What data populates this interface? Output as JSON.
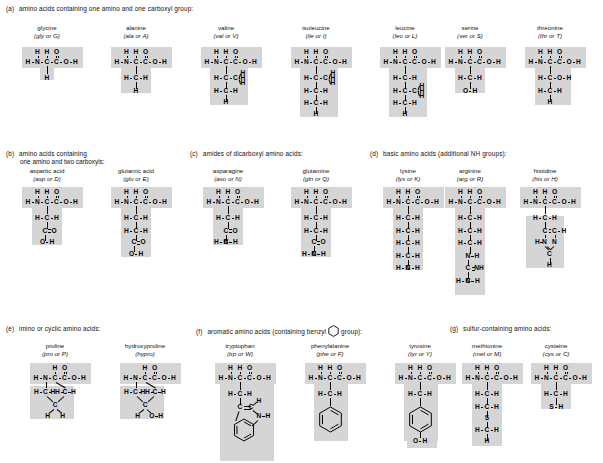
{
  "figure": {
    "shade_color": "#d5d5d5",
    "ink_color": "#000000",
    "background": "#ffffff"
  },
  "sections": [
    {
      "tag": "(a)",
      "heading": "amino acids containing one amino and one carboxyl group:",
      "heading_line2": "",
      "amino_acids": [
        {
          "name": "glycine",
          "abbr": "(gly or G)",
          "three_letter": "gly",
          "one_letter": "G",
          "backbone": "H-N-C-C-O-H",
          "side_chain_atoms": [
            "H"
          ],
          "side_chain_text": "H"
        },
        {
          "name": "alanine",
          "abbr": "(ala or A)",
          "three_letter": "ala",
          "one_letter": "A",
          "backbone": "H-N-C-C-O-H",
          "side_chain_atoms": [
            "H-C-H",
            "H"
          ],
          "side_chain_text": "CH3"
        },
        {
          "name": "valine",
          "abbr": "(val or V)",
          "three_letter": "val",
          "one_letter": "V",
          "backbone": "H-N-C-C-O-H",
          "side_chain_atoms": [
            "H-C-C(H)(H)(H)",
            "H-C-H",
            "H"
          ],
          "side_chain_text": "isopropyl branch"
        },
        {
          "name": "isoleucine",
          "abbr": "(ile or I)",
          "three_letter": "ile",
          "one_letter": "I",
          "backbone": "H-N-C-C-O-H",
          "side_chain_atoms": [
            "H-C-C(H)(H)(H)",
            "H-C-H",
            "H-C-H",
            "H"
          ],
          "side_chain_text": "sec-butyl branch"
        },
        {
          "name": "leucine",
          "abbr": "(leu or L)",
          "three_letter": "leu",
          "one_letter": "L",
          "backbone": "H-N-C-C-O-H",
          "side_chain_atoms": [
            "H-C-H",
            "H-C-C(H)(H)(H)",
            "H-C-H",
            "H"
          ],
          "side_chain_text": "isobutyl branch"
        },
        {
          "name": "serine",
          "abbr": "(ser or S)",
          "three_letter": "ser",
          "one_letter": "S",
          "backbone": "H-N-C-C-O-H",
          "side_chain_atoms": [
            "H-C-H",
            "O-H"
          ],
          "side_chain_text": "CH2OH"
        },
        {
          "name": "threonine",
          "abbr": "(thr or T)",
          "three_letter": "thr",
          "one_letter": "T",
          "backbone": "H-N-C-C-O-H",
          "side_chain_atoms": [
            "H-C-O-H",
            "H-C-H",
            "H"
          ],
          "side_chain_text": "CH(OH)CH3"
        }
      ]
    },
    {
      "tag": "(b)",
      "heading": "amino acids containing",
      "heading_line2": "one amino and two carboxyls:",
      "amino_acids": [
        {
          "name": "aspartic acid",
          "abbr": "(asp or D)",
          "three_letter": "asp",
          "one_letter": "D",
          "backbone": "H-N-C-C-O-H",
          "side_chain_atoms": [
            "H-C-H",
            "C=O",
            "O-H"
          ],
          "side_chain_text": "CH2COOH"
        },
        {
          "name": "glutamic acid",
          "abbr": "(glu or E)",
          "three_letter": "glu",
          "one_letter": "E",
          "backbone": "H-N-C-C-O-H",
          "side_chain_atoms": [
            "H-C-H",
            "H-C-H",
            "C=O",
            "O-H"
          ],
          "side_chain_text": "CH2CH2COOH"
        }
      ]
    },
    {
      "tag": "(c)",
      "heading": "amides of dicarboxyl amino acids:",
      "heading_line2": "",
      "amino_acids": [
        {
          "name": "asparagine",
          "abbr": "(asn or N)",
          "three_letter": "asn",
          "one_letter": "N",
          "backbone": "H-N-C-C-O-H",
          "side_chain_atoms": [
            "H-C-H",
            "C=O",
            "H-N-H"
          ],
          "side_chain_text": "CH2CONH2"
        },
        {
          "name": "glutamine",
          "abbr": "(gln or Q)",
          "three_letter": "gln",
          "one_letter": "Q",
          "backbone": "H-N-C-C-O-H",
          "side_chain_atoms": [
            "H-C-H",
            "H-C-H",
            "C=O",
            "H-N-H"
          ],
          "side_chain_text": "CH2CH2CONH2"
        }
      ]
    },
    {
      "tag": "(d)",
      "heading": "basic amino acids (additional NH groups):",
      "heading_line2": "",
      "amino_acids": [
        {
          "name": "lysine",
          "abbr": "(lys or K)",
          "three_letter": "lys",
          "one_letter": "K",
          "backbone": "H-N-C-C-O-H",
          "side_chain_atoms": [
            "H-C-H",
            "H-C-H",
            "H-C-H",
            "H-C-H",
            "H-N-H"
          ],
          "side_chain_text": "(CH2)4NH2"
        },
        {
          "name": "arginine",
          "abbr": "(arg or R)",
          "three_letter": "arg",
          "one_letter": "R",
          "backbone": "H-N-C-C-O-H",
          "side_chain_atoms": [
            "H-C-H",
            "H-C-H",
            "H-C-H",
            "N-H",
            "C=NH",
            "H-N-H"
          ],
          "side_chain_text": "(CH2)3NHC(=NH)NH2"
        },
        {
          "name": "histidine",
          "abbr": "(his or H)",
          "three_letter": "his",
          "one_letter": "H",
          "backbone": "H-N-C-C-O-H",
          "side_chain_atoms": [
            "H-C-H",
            "C=C-H",
            "H-N   N",
            "C",
            "H"
          ],
          "side_chain_text": "imidazole ring"
        }
      ]
    },
    {
      "tag": "(e)",
      "heading": "imino or cyclic amino acids:",
      "heading_line2": "",
      "amino_acids": [
        {
          "name": "proline",
          "abbr": "(pro or P)",
          "three_letter": "pro",
          "one_letter": "P",
          "backbone": "H-N-C-C-O-H",
          "side_chain_atoms": [
            "H-C-H",
            "H-C-H",
            "C",
            "H",
            "H"
          ],
          "side_chain_text": "pyrrolidine ring"
        },
        {
          "name": "hydroxyproline",
          "abbr": "(hypro)",
          "three_letter": "hypro",
          "one_letter": "",
          "backbone": "H-N-C-C-O-H",
          "side_chain_atoms": [
            "H-C-H",
            "H-C-H",
            "C",
            "H",
            "O-H"
          ],
          "side_chain_text": "hydroxy pyrrolidine ring"
        }
      ]
    },
    {
      "tag": "(f)",
      "heading_pre": "aromatic amino acids (containing benzyl",
      "heading_post": "group):",
      "heading": "aromatic amino acids (containing benzyl group):",
      "heading_line2": "",
      "amino_acids": [
        {
          "name": "tryptophan",
          "abbr": "(trp or W)",
          "three_letter": "trp",
          "one_letter": "W",
          "backbone": "H-N-C-C-O-H",
          "side_chain_atoms": [
            "H-C-H",
            "C=C-H",
            "N-H",
            "benzene ring"
          ],
          "side_chain_text": "indole ring"
        },
        {
          "name": "phenylalanine",
          "abbr": "(phe or F)",
          "three_letter": "phe",
          "one_letter": "F",
          "backbone": "H-N-C-C-O-H",
          "side_chain_atoms": [
            "H-C-H",
            "benzene ring"
          ],
          "side_chain_text": "benzyl"
        },
        {
          "name": "tyrosine",
          "abbr": "(tyr or Y)",
          "three_letter": "tyr",
          "one_letter": "Y",
          "backbone": "H-N-C-C-O-H",
          "side_chain_atoms": [
            "H-C-H",
            "benzene ring",
            "O-H"
          ],
          "side_chain_text": "4-hydroxybenzyl"
        }
      ]
    },
    {
      "tag": "(g)",
      "heading": "sulfur-containing amino acids:",
      "heading_line2": "",
      "amino_acids": [
        {
          "name": "methionine",
          "abbr": "(met or M)",
          "three_letter": "met",
          "one_letter": "M",
          "backbone": "H-N-C-C-O-H",
          "side_chain_atoms": [
            "H-C-H",
            "H-C-H",
            "S",
            "H-C-H",
            "H"
          ],
          "side_chain_text": "CH2CH2SCH3"
        },
        {
          "name": "cysteine",
          "abbr": "(cys or C)",
          "three_letter": "cys",
          "one_letter": "C",
          "backbone": "H-N-C-C-O-H",
          "side_chain_atoms": [
            "H-C-H",
            "S-H"
          ],
          "side_chain_text": "CH2SH"
        }
      ]
    }
  ],
  "atoms": {
    "H": "H",
    "N": "N",
    "C": "C",
    "O": "O",
    "S": "S",
    "dash": "–",
    "OH": "O–H",
    "NH": "N–H",
    "CNH": "C=NH",
    "SH": "S–H"
  }
}
